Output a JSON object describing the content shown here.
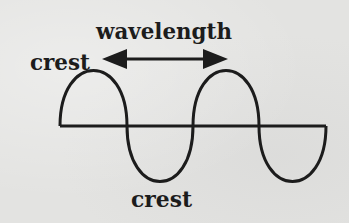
{
  "diagram": {
    "labels": {
      "wavelength": "wavelength",
      "crest_top": "crest",
      "crest_bottom": "crest"
    },
    "colors": {
      "ink": "#1c1c1c",
      "background": "#e3e3e1"
    },
    "wave": {
      "baseline_y": 126,
      "start_x": 60,
      "end_x": 326,
      "half_period_px": 66.5,
      "amplitude_up": 54,
      "amplitude_down": 55,
      "cycles": 2
    },
    "arrow": {
      "y": 59,
      "left_tip_x": 102,
      "right_tip_x": 228,
      "description": "double-headed arrow spanning one wavelength"
    }
  }
}
